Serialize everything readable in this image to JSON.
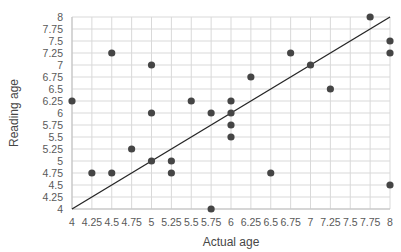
{
  "chart_data": {
    "type": "scatter",
    "title": "",
    "xlabel": "Actual age",
    "ylabel": "Reading age",
    "xlim": [
      4,
      8
    ],
    "ylim": [
      4,
      8
    ],
    "tick_step": 0.25,
    "grid": true,
    "x_tick_labels": [
      "4",
      "4.25",
      "4.5",
      "4.75",
      "5",
      "5.25",
      "5.5",
      "5.75",
      "6",
      "6.25",
      "6.5",
      "6.75",
      "7",
      "7.25",
      "7.5",
      "7.75",
      "8"
    ],
    "y_tick_labels": [
      "4",
      "4.25",
      "4.5",
      "4.75",
      "5",
      "5.25",
      "5.5",
      "5.75",
      "6",
      "6.25",
      "6.5",
      "6.75",
      "7",
      "7.25",
      "7.5",
      "7.75",
      "8"
    ],
    "points": [
      [
        4,
        6.25
      ],
      [
        4.25,
        4.75
      ],
      [
        4.5,
        4.75
      ],
      [
        4.5,
        7.25
      ],
      [
        4.75,
        5.25
      ],
      [
        5,
        5
      ],
      [
        5,
        6
      ],
      [
        5,
        7
      ],
      [
        5.25,
        4.75
      ],
      [
        5.25,
        5
      ],
      [
        5.5,
        6.25
      ],
      [
        5.75,
        4
      ],
      [
        5.75,
        6
      ],
      [
        6,
        5.5
      ],
      [
        6,
        5.75
      ],
      [
        6,
        6
      ],
      [
        6,
        6.25
      ],
      [
        6.25,
        6.75
      ],
      [
        6.5,
        4.75
      ],
      [
        6.75,
        7.25
      ],
      [
        7,
        7
      ],
      [
        7.25,
        6.5
      ],
      [
        7.75,
        8
      ],
      [
        8,
        4.5
      ],
      [
        8,
        7.25
      ],
      [
        8,
        7.5
      ]
    ],
    "identity_line": {
      "x1": 4,
      "y1": 4,
      "x2": 8,
      "y2": 8
    },
    "legend": null,
    "colors": {
      "point": "#454545",
      "grid": "#d9d9d9",
      "axis": "#c0c0c0",
      "tick_text": "#595959",
      "title_text": "#474747",
      "line": "#262626"
    }
  }
}
